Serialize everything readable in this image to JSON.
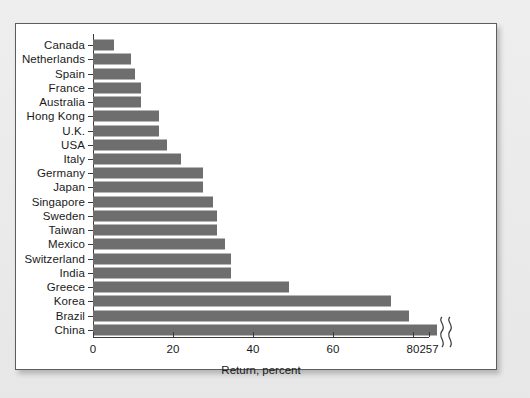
{
  "chart_data": {
    "type": "bar",
    "orientation": "horizontal",
    "title": "",
    "xlabel": "Return, percent",
    "ylabel": "",
    "xlim": [
      0,
      90
    ],
    "grid": false,
    "legend": null,
    "bar_color": "#6e6e6e",
    "panel_background": "#ffffff",
    "figure_background": "#e9e9e9",
    "axis_color": "#3a3a3a",
    "axis_break": {
      "present": true,
      "marker": "squiggle",
      "note": "x-axis is broken between 80 and 257",
      "break_start_value": 86,
      "break_end_value": 90
    },
    "xticks": [
      {
        "label": "0",
        "value": 0
      },
      {
        "label": "20",
        "value": 20
      },
      {
        "label": "40",
        "value": 40
      },
      {
        "label": "60",
        "value": 60
      },
      {
        "label": "80",
        "value": 80
      },
      {
        "label": "257",
        "value": 257
      }
    ],
    "categories": [
      "Canada",
      "Netherlands",
      "Spain",
      "France",
      "Australia",
      "Hong Kong",
      "U.K.",
      "USA",
      "Italy",
      "Germany",
      "Japan",
      "Singapore",
      "Sweden",
      "Taiwan",
      "Mexico",
      "Switzerland",
      "India",
      "Greece",
      "Korea",
      "Brazil",
      "China"
    ],
    "values": [
      5.3,
      9.5,
      10.5,
      12,
      12,
      16.5,
      16.5,
      18.5,
      22,
      27.5,
      27.5,
      30,
      31,
      31,
      33,
      34.5,
      34.5,
      49,
      74.5,
      79,
      257
    ]
  }
}
